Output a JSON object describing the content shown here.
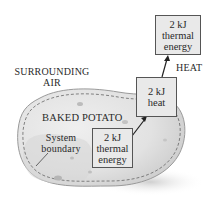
{
  "diagram": {
    "surroundings_label": [
      "SURROUNDING",
      "AIR"
    ],
    "system_label": "BAKED POTATO",
    "boundary_label": [
      "System",
      "boundary"
    ],
    "heat_label": "HEAT",
    "boxes": [
      {
        "id": "inside",
        "lines": [
          "2 kJ",
          "thermal",
          "energy"
        ]
      },
      {
        "id": "transfer",
        "lines": [
          "2 kJ",
          "heat"
        ]
      },
      {
        "id": "outside",
        "lines": [
          "2 kJ",
          "thermal",
          "energy"
        ]
      }
    ],
    "colors": {
      "potato_fill": "#e6e6e6",
      "potato_shade": "#cfcfcf",
      "box_fill": "#e9e9e9",
      "border": "#555555",
      "arrow": "#222222"
    }
  }
}
